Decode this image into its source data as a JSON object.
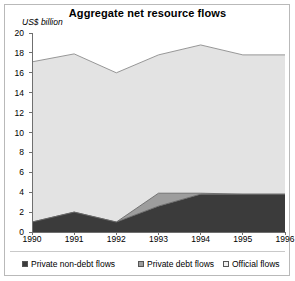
{
  "chart_data": {
    "type": "area",
    "title": "Aggregate net resource flows",
    "xlabel": "",
    "ylabel": "US$ billion",
    "ylim": [
      0,
      20
    ],
    "ytick_step": 2,
    "yticks": [
      "20",
      "18",
      "16",
      "14",
      "12",
      "10",
      "8",
      "6",
      "4",
      "2",
      "0"
    ],
    "grid": false,
    "stacked": true,
    "legend_position": "bottom",
    "categories": [
      "1990",
      "1991",
      "1992",
      "1993",
      "1994",
      "1995",
      "1996"
    ],
    "series": [
      {
        "name": "Private non-debt flows",
        "color": "#3b3b3b",
        "values": [
          1.0,
          2.0,
          1.0,
          2.6,
          3.8,
          3.8,
          3.8
        ]
      },
      {
        "name": "Private debt flows",
        "color": "#9d9d9d",
        "values": [
          0.0,
          0.0,
          0.0,
          1.3,
          0.1,
          0.0,
          0.0
        ]
      },
      {
        "name": "Official flows",
        "color": "#e3e3e3",
        "values": [
          16.1,
          15.9,
          15.0,
          13.9,
          14.9,
          14.0,
          14.0
        ]
      }
    ],
    "totals": [
      17.1,
      17.9,
      16.0,
      17.8,
      18.8,
      17.8,
      17.8
    ]
  },
  "legend": {
    "items": [
      {
        "label": "Private non-debt flows",
        "color": "#3b3b3b"
      },
      {
        "label": "Private debt flows",
        "color": "#9d9d9d"
      },
      {
        "label": "Official flows",
        "color": "#f0f0f0"
      }
    ]
  },
  "colors": {
    "axis": "#6f6f6f",
    "frame": "#b9b9b9",
    "text": "#000000",
    "background": "#ffffff"
  }
}
